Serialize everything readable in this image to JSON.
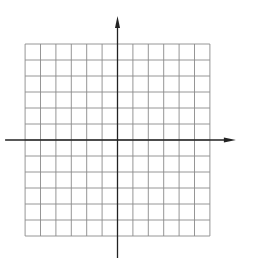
{
  "chart_data": {
    "type": "line",
    "title": "",
    "equation": "y = x − 2",
    "xlabel": "x",
    "ylabel": "y",
    "xlim": [
      -6,
      6
    ],
    "ylim": [
      -6,
      6
    ],
    "grid": true,
    "x_ticks": [
      "−6",
      "−5",
      "−4",
      "−3",
      "−2",
      "−1",
      "0",
      "1",
      "2",
      "3",
      "4",
      "5",
      "6"
    ],
    "y_ticks": [
      "−6",
      "−5",
      "−4",
      "−3",
      "−2",
      "−1",
      "1",
      "2",
      "3",
      "4",
      "5",
      "6"
    ],
    "series": [
      {
        "name": "y = x − 2",
        "x": [
          -4,
          6
        ],
        "y": [
          -6,
          4
        ]
      }
    ],
    "points": [
      {
        "x": 0,
        "y": -2,
        "label": "(0, −2)"
      },
      {
        "x": 2,
        "y": 0,
        "label": "(2, 0)"
      },
      {
        "x": 4,
        "y": 2,
        "label": "(4, 2)"
      }
    ]
  }
}
